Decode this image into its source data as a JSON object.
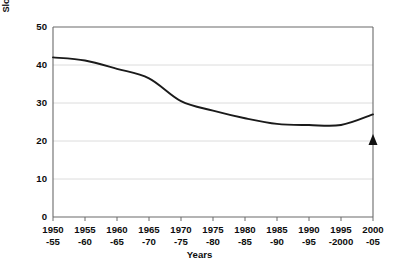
{
  "chart_data": {
    "type": "line",
    "title": "",
    "subtitle": "",
    "xlabel": "Years",
    "ylabel": "Slope index of inequality in life expectancy (years)",
    "categories": [
      "1950\n-55",
      "1955\n-60",
      "1960\n-65",
      "1965\n-70",
      "1970\n-75",
      "1975\n-80",
      "1980\n-85",
      "1985\n-90",
      "1990\n-95",
      "1995\n-2000",
      "2000\n-05"
    ],
    "values": [
      42.0,
      41.2,
      39.0,
      36.5,
      30.5,
      28.0,
      26.0,
      24.5,
      24.2,
      24.2,
      27.0
    ],
    "ylim": [
      0,
      50
    ],
    "yticks": [
      0,
      10,
      20,
      30,
      40,
      50
    ],
    "ytick_labels": [
      "0",
      "10",
      "20",
      "30",
      "40",
      "50"
    ],
    "grid": true,
    "grid_axis": "y",
    "legend": "none",
    "line_color": "#1a1a1a",
    "grid_color": "#dcdcdc",
    "axis_color": "#6b6b6b",
    "annotations": [
      {
        "name": "right-axis-triangle-marker",
        "shape": "triangle-up",
        "x_category": "2000\n-05",
        "y_value": 20,
        "color": "#111111"
      }
    ]
  },
  "axes": {
    "x_ticks": [
      {
        "top": "1950",
        "bottom": "-55"
      },
      {
        "top": "1955",
        "bottom": "-60"
      },
      {
        "top": "1960",
        "bottom": "-65"
      },
      {
        "top": "1965",
        "bottom": "-70"
      },
      {
        "top": "1970",
        "bottom": "-75"
      },
      {
        "top": "1975",
        "bottom": "-80"
      },
      {
        "top": "1980",
        "bottom": "-85"
      },
      {
        "top": "1985",
        "bottom": "-90"
      },
      {
        "top": "1990",
        "bottom": "-95"
      },
      {
        "top": "1995",
        "bottom": "-2000"
      },
      {
        "top": "2000",
        "bottom": "-05"
      }
    ],
    "y_ticks": [
      "50",
      "40",
      "30",
      "20",
      "10",
      "0"
    ],
    "x_title": "Years",
    "y_title": "Slope index of inequality in life expectancy (years)"
  }
}
